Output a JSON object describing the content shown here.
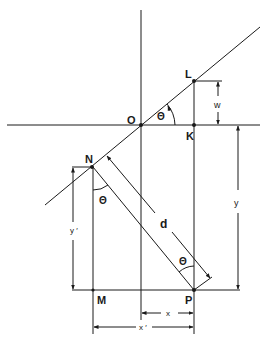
{
  "diagram": {
    "title": "",
    "colors": {
      "line": "#1a1a1a",
      "background": "#ffffff"
    },
    "points": {
      "O": "O",
      "L": "L",
      "K": "K",
      "N": "N",
      "M": "M",
      "P": "P"
    },
    "angles": {
      "theta_at_O": "Θ",
      "theta_at_N": "Θ",
      "theta_at_P": "Θ"
    },
    "dimensions": {
      "w": "w",
      "y": "y",
      "y_prime": "y ′",
      "d": "d",
      "x": "x",
      "x_prime": "x ′"
    }
  }
}
